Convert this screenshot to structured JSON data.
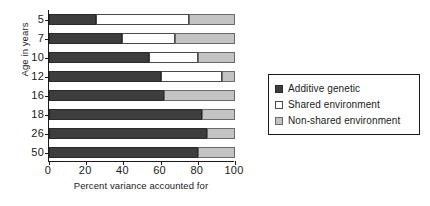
{
  "chart_data": {
    "type": "bar",
    "orientation": "horizontal",
    "stacked": true,
    "title": "",
    "xlabel": "Percent variance accounted for",
    "ylabel": "Age in years",
    "xlim": [
      0,
      100
    ],
    "xticks": [
      0,
      20,
      40,
      60,
      80,
      100
    ],
    "xticklabels": [
      "0",
      "20",
      "40",
      "60",
      "80",
      "100"
    ],
    "grid": false,
    "legend_position": "right",
    "categories": [
      "5",
      "7",
      "10",
      "12",
      "16",
      "18",
      "26",
      "50"
    ],
    "series": [
      {
        "name": "Additive genetic",
        "color": "#3d3d3d",
        "values": [
          25,
          39,
          54,
          60,
          62,
          82,
          85,
          80
        ]
      },
      {
        "name": "Shared environment",
        "color": "#ffffff",
        "values": [
          50,
          29,
          26,
          33,
          0,
          0,
          0,
          0
        ]
      },
      {
        "name": "Non-shared environment",
        "color": "#c3c3c3",
        "values": [
          25,
          32,
          20,
          7,
          38,
          18,
          15,
          20
        ]
      }
    ]
  },
  "legend": {
    "items": [
      {
        "label": "Additive genetic",
        "swatch": "additive"
      },
      {
        "label": "Shared environment",
        "swatch": "shared"
      },
      {
        "label": "Non-shared environment",
        "swatch": "nonshared"
      }
    ]
  }
}
